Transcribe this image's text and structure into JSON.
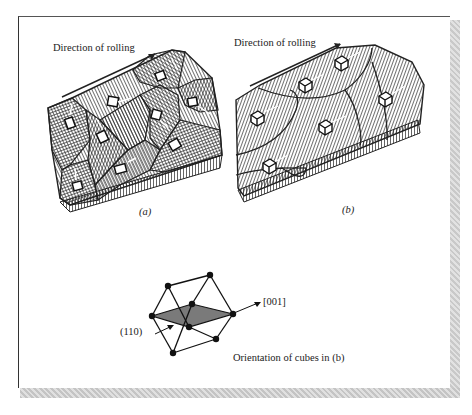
{
  "figure": {
    "panel_a": {
      "caption": "(a)",
      "direction_label": "Direction of rolling",
      "description": "Randomly oriented grains with cubes in various orientations"
    },
    "panel_b": {
      "caption": "(b)",
      "direction_label": "Direction of rolling",
      "description": "Grains with aligned cube orientation (cube texture)"
    },
    "cube_inset": {
      "plane_label": "(110)",
      "direction_label": "[001]",
      "caption": "Orientation of cubes in (b)"
    }
  },
  "colors": {
    "ink": "#222222",
    "hatch": "#333333",
    "plane_fill": "#7a7a7a",
    "shadow": "#cfcfcf"
  }
}
